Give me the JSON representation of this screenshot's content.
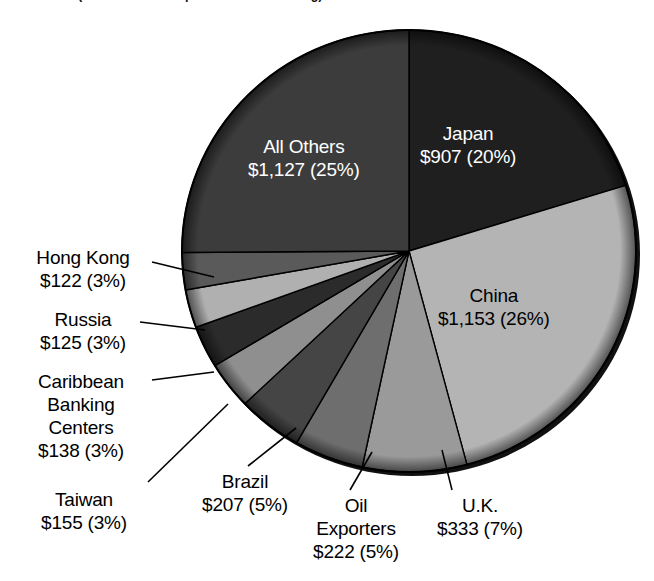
{
  "caption": {
    "text": "(in billions and as percent of outstanding)"
  },
  "chart_data": {
    "type": "pie",
    "title": "",
    "subtitle": "(in billions and as percent of outstanding)",
    "unit": "billions of dollars",
    "legend": "none",
    "start_angle_deg": 0,
    "direction": "clockwise",
    "categories": [
      "Japan",
      "China",
      "U.K.",
      "Oil Exporters",
      "Brazil",
      "Taiwan",
      "Caribbean Banking Centers",
      "Russia",
      "Hong Kong",
      "All Others"
    ],
    "values": [
      907,
      1153,
      333,
      222,
      207,
      155,
      138,
      125,
      122,
      1127
    ],
    "percents": [
      20,
      26,
      7,
      5,
      5,
      3,
      3,
      3,
      3,
      25
    ],
    "value_labels": [
      "$907",
      "$1,153",
      "$333",
      "$222",
      "$207",
      "$155",
      "$138",
      "$125",
      "$122",
      "$1,127"
    ],
    "percent_labels": [
      "(20%)",
      "(26%)",
      "(7%)",
      "(5%)",
      "(5%)",
      "(3%)",
      "(3%)",
      "(3%)",
      "(3%)",
      "(25%)"
    ],
    "colors": [
      "#1f1f1f",
      "#b4b4b4",
      "#9a9a9a",
      "#6e6e6e",
      "#454545",
      "#8f8f8f",
      "#2b2b2b",
      "#b0b0b0",
      "#5a5a5a",
      "#3c3c3c"
    ]
  },
  "slices": {
    "japan": {
      "name": "Japan",
      "value": "$907",
      "percent": "(20%)"
    },
    "china": {
      "name": "China",
      "value": "$1,153",
      "percent": "(26%)"
    },
    "uk": {
      "name": "U.K.",
      "value": "$333",
      "percent": "(7%)"
    },
    "oil": {
      "name": "Oil",
      "name2": "Exporters",
      "value": "$222",
      "percent": "(5%)"
    },
    "brazil": {
      "name": "Brazil",
      "value": "$207",
      "percent": "(5%)"
    },
    "taiwan": {
      "name": "Taiwan",
      "value": "$155",
      "percent": "(3%)"
    },
    "caribbean": {
      "name": "Caribbean",
      "name2": "Banking",
      "name3": "Centers",
      "value": "$138",
      "percent": "(3%)"
    },
    "russia": {
      "name": "Russia",
      "value": "$125",
      "percent": "(3%)"
    },
    "hongkong": {
      "name": "Hong Kong",
      "value": "$122",
      "percent": "(3%)"
    },
    "others": {
      "name": "All Others",
      "value": "$1,127",
      "percent": "(25%)"
    }
  },
  "labels": {
    "japan_line2": "$907 (20%)",
    "china_line2": "$1,153 (26%)",
    "others_line2": "$1,127 (25%)",
    "hongkong_line2": "$122 (3%)",
    "russia_line2": "$125 (3%)",
    "caribbean_line4": "$138 (3%)",
    "taiwan_line2": "$155 (3%)",
    "brazil_line2": "$207 (5%)",
    "oil_line3": "$222 (5%)",
    "uk_line2": "$333 (7%)"
  }
}
